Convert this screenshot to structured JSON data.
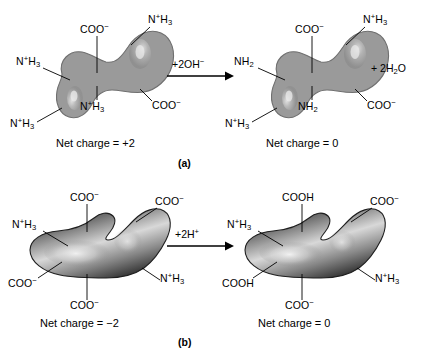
{
  "figure": {
    "background": "#ffffff",
    "blob_gray_fill": "#9a9a9a",
    "blob_dark_fill": "#3a3a3a",
    "line_color": "#000000"
  },
  "panels": [
    {
      "id": "a",
      "panel_label": "(a)",
      "reagent": {
        "prefix": "+2OH",
        "charge": "−"
      },
      "byproduct": {
        "text": "+ 2H",
        "sub": "2",
        "suffix": "O"
      },
      "left": {
        "net_charge": "Net charge = +2",
        "groups": [
          {
            "name": "carboxylate-top",
            "text": "COO",
            "sup": "−",
            "sub": ""
          },
          {
            "name": "ammonium-top-right",
            "text": "N",
            "sup": "+",
            "rest": "H",
            "sub": "3"
          },
          {
            "name": "ammonium-left",
            "text": "N",
            "sup": "+",
            "rest": "H",
            "sub": "3"
          },
          {
            "name": "ammonium-center",
            "text": "N",
            "sup": "+",
            "rest": "H",
            "sub": "3"
          },
          {
            "name": "ammonium-bottom-left",
            "text": "N",
            "sup": "+",
            "rest": "H",
            "sub": "3"
          },
          {
            "name": "carboxylate-right",
            "text": "COO",
            "sup": "−",
            "sub": ""
          }
        ]
      },
      "right": {
        "net_charge": "Net charge = 0",
        "groups": [
          {
            "name": "carboxylate-top",
            "text": "COO",
            "sup": "−",
            "sub": ""
          },
          {
            "name": "ammonium-top-right",
            "text": "N",
            "sup": "+",
            "rest": "H",
            "sub": "3"
          },
          {
            "name": "amine-left",
            "text": "NH",
            "sup": "",
            "sub": "2"
          },
          {
            "name": "amine-center",
            "text": "NH",
            "sup": "",
            "sub": "2"
          },
          {
            "name": "ammonium-bottom-left",
            "text": "N",
            "sup": "+",
            "rest": "H",
            "sub": "3"
          },
          {
            "name": "carboxylate-right",
            "text": "COO",
            "sup": "−",
            "sub": ""
          }
        ]
      }
    },
    {
      "id": "b",
      "panel_label": "(b)",
      "reagent": {
        "prefix": "+2H",
        "charge": "+"
      },
      "left": {
        "net_charge": "Net charge = −2",
        "groups": [
          {
            "name": "carboxylate-top-left",
            "text": "COO",
            "sup": "−"
          },
          {
            "name": "carboxylate-top-right",
            "text": "COO",
            "sup": "−"
          },
          {
            "name": "ammonium-left",
            "text": "N",
            "sup": "+",
            "rest": "H",
            "sub": "3"
          },
          {
            "name": "carboxylate-lower-left",
            "text": "COO",
            "sup": "−"
          },
          {
            "name": "carboxylate-bottom",
            "text": "COO",
            "sup": "−"
          },
          {
            "name": "ammonium-right",
            "text": "N",
            "sup": "+",
            "rest": "H",
            "sub": "3"
          }
        ]
      },
      "right": {
        "net_charge": "Net charge = 0",
        "groups": [
          {
            "name": "carboxyl-top-left",
            "text": "COOH",
            "sup": ""
          },
          {
            "name": "carboxylate-top-right",
            "text": "COO",
            "sup": "−"
          },
          {
            "name": "ammonium-left",
            "text": "N",
            "sup": "+",
            "rest": "H",
            "sub": "3"
          },
          {
            "name": "carboxyl-lower-left",
            "text": "COOH",
            "sup": ""
          },
          {
            "name": "carboxylate-bottom",
            "text": "COO",
            "sup": "−"
          },
          {
            "name": "ammonium-right",
            "text": "N",
            "sup": "+",
            "rest": "H",
            "sub": "3"
          }
        ]
      }
    }
  ],
  "text": {
    "a_left_net": "Net charge = +2",
    "a_right_net": "Net charge = 0",
    "b_left_net": "Net charge = −2",
    "b_right_net": "Net charge = 0",
    "label_a": "(a)",
    "label_b": "(b)"
  }
}
